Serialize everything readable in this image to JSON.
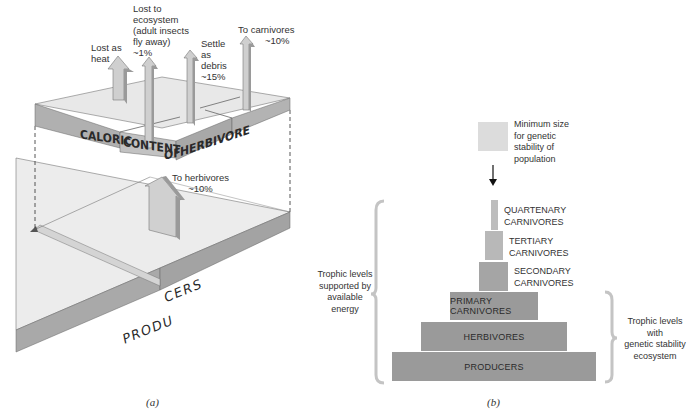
{
  "figure": {
    "panel_a": {
      "caption": "(a)",
      "top_block_label_parts": [
        "CALORIC",
        "CONTENT",
        "OF",
        "HERBIVORE"
      ],
      "bottom_block_label_parts": [
        "PRODU",
        "CERS"
      ],
      "arrows": [
        {
          "id": "heat",
          "label_lines": [
            "Lost as",
            "heat"
          ]
        },
        {
          "id": "ecosystem",
          "label_lines": [
            "Lost to",
            "ecosystem",
            "(adult insects",
            "fly away)",
            "~1%"
          ]
        },
        {
          "id": "debris",
          "label_lines": [
            "Settle",
            "as",
            "debris",
            "~15%"
          ]
        },
        {
          "id": "carnivores",
          "label_lines": [
            "To carnivores",
            "~10%"
          ]
        },
        {
          "id": "herbivores",
          "label_lines": [
            "To herbivores",
            "~10%"
          ]
        }
      ]
    },
    "panel_b": {
      "caption": "(b)",
      "min_size_box_label_lines": [
        "Minimum size",
        "for genetic",
        "stability of",
        "population"
      ],
      "levels": [
        {
          "name": "QUARTENARY CARNIVORES",
          "lines": [
            "QUARTENARY",
            "CARNIVORES"
          ],
          "label_outside": true
        },
        {
          "name": "TERTIARY CARNIVORES",
          "lines": [
            "TERTIARY",
            "CARNIVORES"
          ],
          "label_outside": true
        },
        {
          "name": "SECONDARY CARNIVORES",
          "lines": [
            "SECONDARY",
            "CARNIVORES"
          ],
          "label_outside": true
        },
        {
          "name": "PRIMARY CARNIVORES",
          "label": "PRIMARY CARNIVORES",
          "label_outside": false
        },
        {
          "name": "HERBIVORES",
          "label": "HERBIVORES",
          "label_outside": false
        },
        {
          "name": "PRODUCERS",
          "label": "PRODUCERS",
          "label_outside": false
        }
      ],
      "left_brace_label_lines": [
        "Trophic levels",
        "supported by",
        "available",
        "energy"
      ],
      "right_brace_label_lines": [
        "Trophic levels",
        "with",
        "genetic stability",
        "ecosystem"
      ]
    },
    "colors": {
      "top_face": "#e6e6e6",
      "side_face": "#a8a8a8",
      "pyramid_dark": "#999999",
      "pyramid_light": "#bdbdbd",
      "min_box": "#dcdcdc",
      "brace": "#c4c4c4"
    }
  }
}
